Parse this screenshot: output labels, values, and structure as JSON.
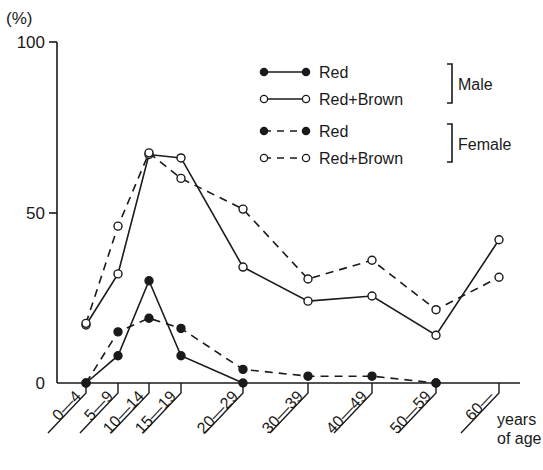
{
  "chart_data": {
    "type": "line",
    "title": "",
    "caption": "図 1 ... (illegible caption, partially cropped)",
    "ylabel": "(%)",
    "xlabel": "years of age",
    "xlabel_lines": [
      "years",
      "of age"
    ],
    "ylim": [
      0,
      100
    ],
    "yticks": [
      0,
      50,
      100
    ],
    "grid": false,
    "legend_position": "upper right",
    "categories": [
      "0—4",
      "5—9",
      "10—14",
      "15—19",
      "20—29",
      "30—39",
      "40—49",
      "50—59",
      "60—"
    ],
    "series": [
      {
        "name": "Red",
        "group": "Male",
        "style": "solid",
        "marker": "filled",
        "values": [
          0,
          8,
          30,
          8,
          0,
          null,
          null,
          0,
          null
        ]
      },
      {
        "name": "Red+Brown",
        "group": "Male",
        "style": "solid",
        "marker": "open",
        "values": [
          17,
          32,
          67,
          66,
          34,
          24,
          25.5,
          14,
          42
        ]
      },
      {
        "name": "Red",
        "group": "Female",
        "style": "dashed",
        "marker": "filled",
        "values": [
          0,
          15,
          19,
          16,
          4,
          2,
          2,
          0,
          null
        ]
      },
      {
        "name": "Red+Brown",
        "group": "Female",
        "style": "dashed",
        "marker": "open",
        "values": [
          17.5,
          46,
          67.5,
          60,
          51,
          30.5,
          36,
          21.5,
          31
        ]
      }
    ],
    "legend": {
      "male_label": "Male",
      "female_label": "Female",
      "entries": [
        "Red",
        "Red+Brown",
        "Red",
        "Red+Brown"
      ]
    }
  }
}
